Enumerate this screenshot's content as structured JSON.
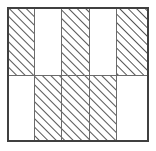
{
  "figure": {
    "type": "grid",
    "colors": {
      "background": "#ffffff",
      "outer_border": "#404040",
      "inner_line": "#6b6b6b",
      "hatch_line": "#555555"
    },
    "geometry": {
      "outer_left": 7,
      "outer_top": 7,
      "outer_right": 149,
      "outer_bottom": 142,
      "columns": 5,
      "rows": 2,
      "column_edges": [
        7,
        41.4,
        75.8,
        110.2,
        144.6,
        149
      ],
      "row_divider_y": 75,
      "outer_border_width": 2,
      "inner_line_width": 1,
      "hatch_spacing": 6,
      "hatch_angle_degrees": 45
    },
    "cells": [
      {
        "id": "r1c1",
        "row": 1,
        "col": 1,
        "x": 7,
        "y": 7,
        "w": 27.4,
        "h": 68,
        "hatched": true
      },
      {
        "id": "r1c2",
        "row": 1,
        "col": 2,
        "x": 34.4,
        "y": 7,
        "w": 27.4,
        "h": 68,
        "hatched": false
      },
      {
        "id": "r1c3",
        "row": 1,
        "col": 3,
        "x": 61.8,
        "y": 7,
        "w": 27.4,
        "h": 68,
        "hatched": true
      },
      {
        "id": "r1c4",
        "row": 1,
        "col": 4,
        "x": 89.2,
        "y": 7,
        "w": 27.4,
        "h": 68,
        "hatched": false
      },
      {
        "id": "r1c5",
        "row": 1,
        "col": 5,
        "x": 116.6,
        "y": 7,
        "w": 32.4,
        "h": 68,
        "hatched": true
      },
      {
        "id": "r2c1",
        "row": 2,
        "col": 1,
        "x": 7,
        "y": 75,
        "w": 27.4,
        "h": 67,
        "hatched": false
      },
      {
        "id": "r2c2",
        "row": 2,
        "col": 2,
        "x": 34.4,
        "y": 75,
        "w": 27.4,
        "h": 67,
        "hatched": true
      },
      {
        "id": "r2c3",
        "row": 2,
        "col": 3,
        "x": 61.8,
        "y": 75,
        "w": 27.4,
        "h": 67,
        "hatched": true
      },
      {
        "id": "r2c4",
        "row": 2,
        "col": 4,
        "x": 89.2,
        "y": 75,
        "w": 27.4,
        "h": 67,
        "hatched": true
      },
      {
        "id": "r2c5",
        "row": 2,
        "col": 5,
        "x": 116.6,
        "y": 75,
        "w": 32.4,
        "h": 67,
        "hatched": false
      }
    ],
    "internal_vertical_lines": [
      {
        "id": "vline-1",
        "x": 34.4,
        "y1": 7,
        "y2": 142
      },
      {
        "id": "vline-2",
        "x": 61.8,
        "y1": 7,
        "y2": 142
      },
      {
        "id": "vline-3",
        "x": 89.2,
        "y1": 7,
        "y2": 142
      },
      {
        "id": "vline-4",
        "x": 116.6,
        "y1": 7,
        "y2": 142
      }
    ],
    "internal_horizontal_lines": [
      {
        "id": "hline-1",
        "y": 75,
        "x1": 7,
        "x2": 149
      }
    ]
  }
}
